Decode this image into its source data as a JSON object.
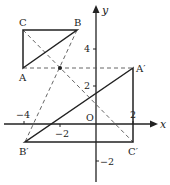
{
  "diagram": {
    "axes": {
      "x_label": "x",
      "y_label": "y",
      "origin_label": "O",
      "x_ticks": [
        "−4",
        "−2",
        "2"
      ],
      "y_ticks": [
        "4",
        "2",
        "−2"
      ]
    },
    "points": {
      "A": "A",
      "B": "B",
      "C": "C",
      "A_prime": "A′",
      "B_prime": "B′",
      "C_prime": "C′"
    },
    "coordinates": {
      "A": [
        -4,
        3
      ],
      "B": [
        -1,
        5
      ],
      "C": [
        -4,
        5
      ],
      "A_prime": [
        2,
        3
      ],
      "B_prime": [
        -4,
        -1
      ],
      "C_prime": [
        2,
        -1
      ],
      "center_of_rotation": [
        -2,
        3
      ]
    },
    "colors": {
      "line": "#222222",
      "dashed": "#555555"
    }
  }
}
